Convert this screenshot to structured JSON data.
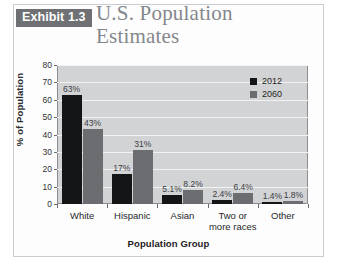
{
  "header": {
    "exhibit_badge": "Exhibit 1.3",
    "title_line1": "U.S. Population",
    "title_line2": "Estimates"
  },
  "chart_data": {
    "type": "bar",
    "title": "U.S. Population Estimates",
    "xlabel": "Population Group",
    "ylabel": "% of Population",
    "ylim": [
      0,
      80
    ],
    "yticks": [
      0,
      10,
      20,
      30,
      40,
      50,
      60,
      70,
      80
    ],
    "grid": true,
    "legend_position": "top-right",
    "categories": [
      "White",
      "Hispanic",
      "Asian",
      "Two or more races",
      "Other"
    ],
    "category_lines": [
      [
        "White"
      ],
      [
        "Hispanic"
      ],
      [
        "Asian"
      ],
      [
        "Two or",
        "more races"
      ],
      [
        "Other"
      ]
    ],
    "series": [
      {
        "name": "2012",
        "color": "#141516",
        "values": [
          63,
          17,
          5.1,
          2.4,
          1.4
        ],
        "labels": [
          "63%",
          "17%",
          "5.1%",
          "2.4%",
          "1.4%"
        ]
      },
      {
        "name": "2060",
        "color": "#6b6d70",
        "values": [
          43,
          31,
          8.2,
          6.4,
          1.8
        ],
        "labels": [
          "43%",
          "31%",
          "8.2%",
          "6.4%",
          "1.8%"
        ]
      }
    ]
  },
  "colors": {
    "badge_background": "#6e7074",
    "title_text": "#84878c",
    "plot_background": "#d2d3d5",
    "gridline": "#f2f2f3",
    "axis": "#8b8d90"
  }
}
